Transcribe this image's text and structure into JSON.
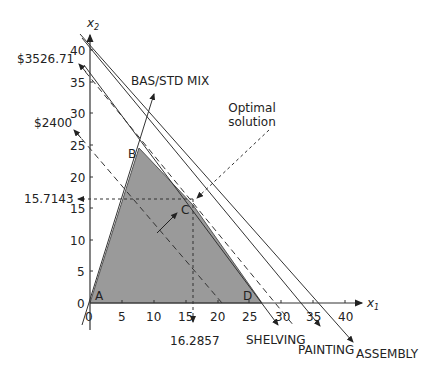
{
  "diagram": {
    "axes": {
      "x_label": "x",
      "x_sub": "1",
      "y_label": "x",
      "y_sub": "2",
      "x_ticks": [
        "0",
        "5",
        "10",
        "15",
        "20",
        "25",
        "30",
        "35",
        "40"
      ],
      "y_ticks": [
        "0",
        "5",
        "10",
        "15",
        "20",
        "25",
        "30",
        "35",
        "40"
      ]
    },
    "points": {
      "A": "A",
      "B": "B",
      "C": "C",
      "D": "D"
    },
    "constraints": {
      "bas_std_mix": "BAS/STD MIX",
      "shelving": "SHELVING",
      "painting": "PAINTING",
      "assembly": "ASSEMBLY"
    },
    "annotations": {
      "optimal_line1": "Optimal",
      "optimal_line2": "solution",
      "profit_high": "$3526.71",
      "profit_low": "$2400",
      "c_x2": "15.7143",
      "c_x1": "16.2857"
    },
    "colors": {
      "feasible_region": "#999999",
      "lines": "#333333"
    }
  }
}
